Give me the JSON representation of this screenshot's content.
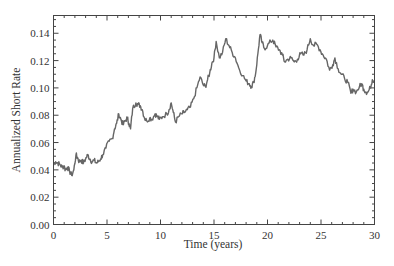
{
  "chart_data": {
    "type": "line",
    "title": "",
    "xlabel": "Time (years)",
    "ylabel": "Annualized Short Rate",
    "xlim": [
      0,
      30
    ],
    "ylim": [
      0.0,
      0.153
    ],
    "x_ticks": [
      0,
      5,
      10,
      15,
      20,
      25,
      30
    ],
    "x_tick_labels": [
      "0",
      "5",
      "10",
      "15",
      "20",
      "25",
      "30"
    ],
    "y_ticks": [
      0.0,
      0.02,
      0.04,
      0.06,
      0.08,
      0.1,
      0.12,
      0.14
    ],
    "y_tick_labels": [
      "0.00",
      "0.02",
      "0.04",
      "0.06",
      "0.08",
      "0.10",
      "0.12",
      "0.14"
    ],
    "x_minor_step": 1,
    "y_minor_step": 0.005,
    "grid": false,
    "legend": null,
    "line_color": "#666666",
    "series": [
      {
        "name": "Short rate",
        "x": [
          0,
          0.2,
          0.4,
          0.6,
          0.8,
          1.0,
          1.1,
          1.3,
          1.5,
          1.7,
          1.9,
          2.1,
          2.25,
          2.4,
          2.6,
          2.8,
          3.0,
          3.2,
          3.4,
          3.6,
          3.8,
          4.0,
          4.2,
          4.4,
          4.6,
          4.9,
          5.2,
          5.5,
          5.7,
          5.9,
          6.1,
          6.3,
          6.5,
          6.7,
          6.9,
          7.05,
          7.2,
          7.4,
          7.7,
          7.9,
          8.1,
          8.3,
          8.5,
          8.7,
          9.0,
          9.2,
          9.5,
          9.7,
          9.9,
          10.2,
          10.6,
          10.8,
          11.0,
          11.2,
          11.4,
          11.7,
          12.0,
          12.2,
          12.5,
          12.8,
          13.1,
          13.4,
          13.7,
          14.0,
          14.2,
          14.4,
          14.6,
          14.8,
          15.0,
          15.2,
          15.5,
          15.8,
          16.1,
          16.4,
          16.7,
          17.0,
          17.3,
          17.7,
          18.0,
          18.3,
          18.5,
          18.7,
          18.9,
          19.1,
          19.3,
          19.5,
          19.7,
          20.0,
          20.3,
          20.5,
          20.8,
          21.1,
          21.4,
          21.6,
          21.9,
          22.2,
          22.5,
          22.8,
          23.1,
          23.4,
          23.7,
          24.0,
          24.3,
          24.6,
          24.9,
          25.2,
          25.5,
          25.8,
          26.1,
          26.3,
          26.6,
          26.9,
          27.2,
          27.5,
          27.8,
          28.0,
          28.3,
          28.6,
          28.8,
          29.0,
          29.2,
          29.4,
          29.6,
          29.8,
          30.0
        ],
        "values": [
          0.044,
          0.046,
          0.045,
          0.044,
          0.042,
          0.043,
          0.04,
          0.042,
          0.039,
          0.036,
          0.04,
          0.051,
          0.049,
          0.046,
          0.047,
          0.045,
          0.048,
          0.051,
          0.048,
          0.046,
          0.047,
          0.045,
          0.046,
          0.048,
          0.051,
          0.056,
          0.061,
          0.063,
          0.07,
          0.074,
          0.081,
          0.077,
          0.073,
          0.076,
          0.078,
          0.074,
          0.07,
          0.085,
          0.089,
          0.088,
          0.087,
          0.084,
          0.078,
          0.076,
          0.078,
          0.077,
          0.081,
          0.079,
          0.077,
          0.079,
          0.081,
          0.084,
          0.089,
          0.082,
          0.075,
          0.079,
          0.081,
          0.082,
          0.084,
          0.086,
          0.092,
          0.1,
          0.108,
          0.102,
          0.101,
          0.106,
          0.111,
          0.118,
          0.122,
          0.134,
          0.122,
          0.126,
          0.136,
          0.131,
          0.126,
          0.122,
          0.115,
          0.109,
          0.105,
          0.103,
          0.101,
          0.104,
          0.111,
          0.125,
          0.139,
          0.133,
          0.129,
          0.131,
          0.134,
          0.135,
          0.13,
          0.128,
          0.124,
          0.119,
          0.121,
          0.122,
          0.119,
          0.121,
          0.125,
          0.124,
          0.128,
          0.136,
          0.131,
          0.132,
          0.128,
          0.124,
          0.121,
          0.113,
          0.117,
          0.122,
          0.114,
          0.11,
          0.107,
          0.104,
          0.096,
          0.099,
          0.097,
          0.101,
          0.103,
          0.099,
          0.097,
          0.097,
          0.1,
          0.106,
          0.105
        ]
      }
    ]
  }
}
